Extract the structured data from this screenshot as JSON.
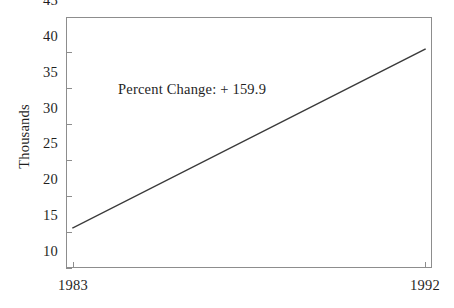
{
  "chart_data": {
    "type": "line",
    "title": "",
    "xlabel": "",
    "ylabel": "Thousands",
    "x": [
      1983,
      1992
    ],
    "xtick_labels": [
      "1983",
      "1992"
    ],
    "xlim": [
      1983,
      1992
    ],
    "values": [
      15.6,
      40.5
    ],
    "series": [
      {
        "name": "",
        "values": [
          15.6,
          40.5
        ]
      }
    ],
    "ylim": [
      10,
      45
    ],
    "ytick_labels": [
      "45",
      "40",
      "35",
      "30",
      "25",
      "20",
      "15",
      "10"
    ],
    "ytick_values": [
      45,
      40,
      35,
      30,
      25,
      20,
      15,
      10
    ],
    "grid": false,
    "legend": false,
    "annotations": [
      {
        "text": "Percent Change:  + 159.9",
        "x": 1984.2,
        "y": 37.2
      }
    ],
    "line_color": "#3a3a3a",
    "frame_color": "#8d8d8d",
    "background_color": "#ffffff"
  },
  "axes": {
    "y_title": "Thousands",
    "y_ticks": [
      {
        "label": "45",
        "value": 45
      },
      {
        "label": "40",
        "value": 40
      },
      {
        "label": "35",
        "value": 35
      },
      {
        "label": "30",
        "value": 30
      },
      {
        "label": "25",
        "value": 25
      },
      {
        "label": "20",
        "value": 20
      },
      {
        "label": "15",
        "value": 15
      },
      {
        "label": "10",
        "value": 10
      }
    ],
    "x_ticks": [
      {
        "label": "1983",
        "value": 1983
      },
      {
        "label": "1992",
        "value": 1992
      }
    ]
  },
  "annotation": {
    "text": "Percent Change:  + 159.9"
  }
}
